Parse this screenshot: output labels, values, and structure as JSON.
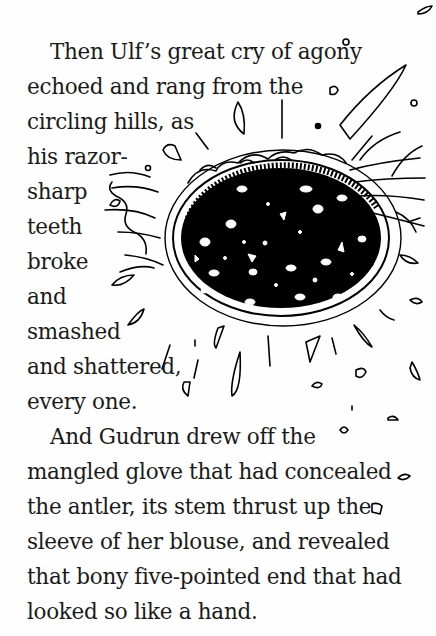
{
  "page": {
    "paragraphs": [
      {
        "lines": [
          "Then Ulf’s great cry of agony",
          "echoed and rang from the",
          "circling hills, as",
          "his razor-",
          "sharp",
          "teeth",
          "broke",
          "and",
          "smashed",
          "and shattered,",
          "every one."
        ]
      },
      {
        "lines": [
          "And Gudrun drew off the",
          "mangled glove that had concealed",
          "the antler, its stem thrust up the",
          "sleeve of her blouse, and revealed",
          "that bony five-pointed end that had",
          "looked so like a hand."
        ]
      }
    ],
    "illustration": {
      "subject": "shattering-teeth-mouth-illustration",
      "ink_color": "#000000",
      "paper_color": "#fefefe"
    }
  }
}
